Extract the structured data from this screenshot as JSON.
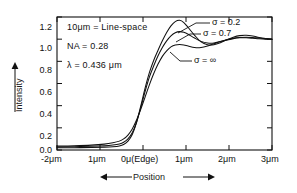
{
  "chart_data": {
    "type": "line",
    "title": "",
    "xlabel": "Position",
    "ylabel": "Intensity",
    "xlim": [
      -2,
      3
    ],
    "ylim": [
      0.0,
      1.2
    ],
    "grid": false,
    "legend_position": "inline-annotations",
    "x_tick_labels": [
      "-2μm",
      "1μm",
      "0μ(Edge)",
      "1μm",
      "2μm",
      "3μm"
    ],
    "x_tick_values": [
      -2,
      -1,
      0,
      1,
      2,
      3
    ],
    "y_tick_labels": [
      "0.0",
      "0.2",
      "0.4",
      "0.6",
      "0.8",
      "1.0",
      "1.2"
    ],
    "y_tick_values": [
      0.0,
      0.2,
      0.4,
      0.6,
      0.8,
      1.0,
      1.2
    ],
    "annotations": [
      "10μm = Line-space",
      "NA = 0.28",
      "λ = 0.436 μm"
    ],
    "series": [
      {
        "name": "σ = 0.2",
        "label": "σ = 0.2",
        "x": [
          -2.0,
          -1.6,
          -1.2,
          -0.9,
          -0.7,
          -0.55,
          -0.45,
          -0.35,
          -0.25,
          -0.15,
          -0.05,
          0.05,
          0.15,
          0.25,
          0.35,
          0.45,
          0.55,
          0.65,
          0.75,
          0.85,
          0.95,
          1.05,
          1.2,
          1.35,
          1.5,
          1.65,
          1.8,
          1.95,
          2.1,
          2.25,
          2.4,
          2.55,
          2.7,
          2.85,
          3.0
        ],
        "y": [
          0.02,
          0.021,
          0.023,
          0.026,
          0.03,
          0.037,
          0.05,
          0.08,
          0.14,
          0.25,
          0.4,
          0.56,
          0.7,
          0.81,
          0.9,
          0.985,
          1.06,
          1.12,
          1.158,
          1.17,
          1.15,
          1.105,
          1.035,
          0.975,
          0.95,
          0.95,
          0.968,
          0.995,
          1.018,
          1.032,
          1.035,
          1.028,
          1.015,
          1.005,
          1.0
        ]
      },
      {
        "name": "σ = 0.7",
        "label": "σ = 0.7",
        "x": [
          -2.0,
          -1.6,
          -1.2,
          -0.9,
          -0.7,
          -0.55,
          -0.45,
          -0.35,
          -0.25,
          -0.15,
          -0.05,
          0.05,
          0.15,
          0.25,
          0.35,
          0.45,
          0.55,
          0.65,
          0.75,
          0.85,
          0.95,
          1.05,
          1.2,
          1.35,
          1.5,
          1.65,
          1.8,
          1.95,
          2.1,
          2.25,
          2.4,
          2.55,
          2.7,
          2.85,
          3.0
        ],
        "y": [
          0.028,
          0.03,
          0.033,
          0.038,
          0.045,
          0.055,
          0.07,
          0.1,
          0.155,
          0.25,
          0.385,
          0.53,
          0.66,
          0.76,
          0.85,
          0.925,
          0.985,
          1.03,
          1.058,
          1.068,
          1.062,
          1.045,
          1.01,
          0.98,
          0.965,
          0.965,
          0.978,
          0.992,
          1.005,
          1.012,
          1.012,
          1.008,
          1.003,
          1.0,
          1.0
        ]
      },
      {
        "name": "σ = ∞",
        "label": "σ = ∞",
        "x": [
          -2.0,
          -1.6,
          -1.2,
          -0.9,
          -0.7,
          -0.55,
          -0.45,
          -0.35,
          -0.25,
          -0.15,
          -0.05,
          0.05,
          0.15,
          0.25,
          0.35,
          0.45,
          0.55,
          0.65,
          0.75,
          0.85,
          0.95,
          1.05,
          1.2,
          1.35,
          1.5,
          1.65,
          1.8,
          1.95,
          2.1,
          2.25,
          2.4,
          2.55,
          2.7,
          2.85,
          3.0
        ],
        "y": [
          0.035,
          0.038,
          0.044,
          0.053,
          0.065,
          0.08,
          0.1,
          0.135,
          0.19,
          0.27,
          0.37,
          0.48,
          0.59,
          0.69,
          0.775,
          0.845,
          0.895,
          0.93,
          0.948,
          0.952,
          0.948,
          0.938,
          0.925,
          0.925,
          0.938,
          0.958,
          0.978,
          0.995,
          1.008,
          1.015,
          1.018,
          1.015,
          1.01,
          1.005,
          1.0
        ]
      }
    ]
  },
  "axes": {
    "y_axis_title": "Intensity",
    "x_axis_title": "Position"
  }
}
